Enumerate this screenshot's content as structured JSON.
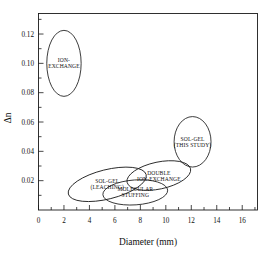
{
  "chart_data": {
    "type": "scatter",
    "title": "",
    "xlabel": "Diameter (mm)",
    "ylabel": "Δn",
    "xlim": [
      0,
      17.2
    ],
    "ylim": [
      0,
      0.134
    ],
    "grid": false,
    "legend": "none",
    "xticks": [
      "0",
      "2",
      "4",
      "6",
      "8",
      "10",
      "12",
      "14",
      "16"
    ],
    "xtick_values": [
      0,
      2,
      4,
      6,
      8,
      10,
      12,
      14,
      16
    ],
    "xminor_step": 1,
    "yticks": [
      "0.02",
      "0.04",
      "0.06",
      "0.08",
      "0.10",
      "0.12"
    ],
    "ytick_values": [
      0.02,
      0.04,
      0.06,
      0.08,
      0.1,
      0.12
    ],
    "yminor_step": 0.01,
    "series": [
      {
        "name": "ION-EXCHANGE",
        "label_lines": [
          "ION-",
          "EXCHANGE"
        ],
        "shape": "ellipse",
        "center": [
          2.0,
          0.1
        ],
        "rx": 1.35,
        "ry": 0.0225,
        "rotation": 0
      },
      {
        "name": "SOL-GEL (LEACHING)",
        "label_lines": [
          "SOL-GEL",
          "(LEACHING)"
        ],
        "shape": "ellipse",
        "center": [
          5.4,
          0.0175
        ],
        "rx": 3.15,
        "ry": 0.01,
        "rotation": -14
      },
      {
        "name": "MOLECULAR STUFFING",
        "label_lines": [
          "MOLECULAR",
          "STUFFING"
        ],
        "shape": "ellipse",
        "center": [
          7.6,
          0.012
        ],
        "rx": 2.55,
        "ry": 0.0085,
        "rotation": -4
      },
      {
        "name": "DOUBLE ION-EXCHANGE",
        "label_lines": [
          "DOUBLE",
          "ION-EXCHANGE"
        ],
        "shape": "ellipse",
        "center": [
          9.45,
          0.0235
        ],
        "rx": 2.55,
        "ry": 0.0092,
        "rotation": -12
      },
      {
        "name": "SOL-GEL (THIS STUDY)",
        "label_lines": [
          "SOL-GEL",
          "(THIS STUDY)"
        ],
        "shape": "ellipse",
        "center": [
          12.1,
          0.0465
        ],
        "rx": 1.45,
        "ry": 0.0172,
        "rotation": 0
      }
    ]
  },
  "figure": {
    "caption": ""
  }
}
